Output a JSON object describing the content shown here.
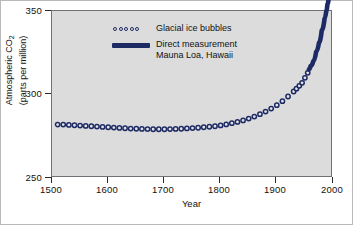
{
  "chart_data": {
    "type": "scatter",
    "title": "",
    "xlabel": "Year",
    "ylabel": "Atmospheric CO2 (parts per million)",
    "ylabel_line1": "Atmospheric CO",
    "ylabel_sub": "2",
    "ylabel_line2": "(parts per million)",
    "xlim": [
      1500,
      2000
    ],
    "ylim": [
      250,
      350
    ],
    "xticks": [
      1500,
      1600,
      1700,
      1800,
      1900,
      2000
    ],
    "xtick_labels": [
      "1500",
      "1600",
      "1700",
      "1800",
      "1900",
      "2000"
    ],
    "yticks": [
      250,
      300,
      350
    ],
    "ytick_labels": [
      "250",
      "300",
      "350"
    ],
    "grid": false,
    "legend_position": "inside-top-left",
    "plot_background_color": "#dcdcdc",
    "series_color": "#1d2a63",
    "series": [
      {
        "name": "Glacial ice bubbles",
        "marker": "open-circle",
        "points": [
          [
            1510,
            282.0
          ],
          [
            1520,
            282.0
          ],
          [
            1530,
            281.8
          ],
          [
            1540,
            281.6
          ],
          [
            1550,
            281.4
          ],
          [
            1560,
            281.2
          ],
          [
            1570,
            281.0
          ],
          [
            1580,
            280.8
          ],
          [
            1590,
            280.6
          ],
          [
            1600,
            280.4
          ],
          [
            1610,
            280.2
          ],
          [
            1620,
            280.0
          ],
          [
            1630,
            279.8
          ],
          [
            1640,
            279.6
          ],
          [
            1650,
            279.5
          ],
          [
            1660,
            279.4
          ],
          [
            1670,
            279.3
          ],
          [
            1680,
            279.2
          ],
          [
            1690,
            279.2
          ],
          [
            1700,
            279.2
          ],
          [
            1710,
            279.3
          ],
          [
            1720,
            279.4
          ],
          [
            1730,
            279.5
          ],
          [
            1740,
            279.7
          ],
          [
            1750,
            279.9
          ],
          [
            1760,
            280.1
          ],
          [
            1770,
            280.4
          ],
          [
            1780,
            280.7
          ],
          [
            1790,
            281.0
          ],
          [
            1800,
            281.5
          ],
          [
            1810,
            282.1
          ],
          [
            1820,
            282.8
          ],
          [
            1830,
            283.6
          ],
          [
            1840,
            284.5
          ],
          [
            1850,
            285.6
          ],
          [
            1860,
            286.8
          ],
          [
            1870,
            288.2
          ],
          [
            1880,
            289.8
          ],
          [
            1890,
            291.6
          ],
          [
            1900,
            293.6
          ],
          [
            1910,
            296.0
          ],
          [
            1920,
            298.8
          ],
          [
            1930,
            301.8
          ],
          [
            1935,
            303.5
          ],
          [
            1940,
            305.2
          ],
          [
            1945,
            307.0
          ],
          [
            1950,
            310.0
          ],
          [
            1955,
            313.0
          ]
        ]
      },
      {
        "name": "Direct measurement Mauna Loa, Hawaii",
        "marker": "thick-line",
        "points": [
          [
            1957,
            315.0
          ],
          [
            1960,
            317.0
          ],
          [
            1965,
            320.0
          ],
          [
            1970,
            325.5
          ],
          [
            1975,
            331.0
          ],
          [
            1980,
            338.5
          ],
          [
            1985,
            345.5
          ],
          [
            1988,
            350.0
          ],
          [
            1990,
            354.0
          ],
          [
            1993,
            360.0
          ]
        ]
      }
    ]
  },
  "legend": {
    "items": [
      {
        "key": "glacial-ice-bubbles",
        "label": "Glacial ice bubbles",
        "sublabel": ""
      },
      {
        "key": "direct-measurement",
        "label": "Direct measurement",
        "sublabel": "Mauna Loa, Hawaii"
      }
    ]
  }
}
